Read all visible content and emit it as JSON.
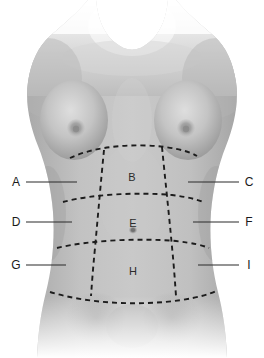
{
  "figure": {
    "width": 264,
    "height": 358,
    "background_color": "#ffffff",
    "skin_tone_mid": "#b9b9b9",
    "skin_tone_shadow": "#8f8f8f",
    "skin_tone_highlight": "#d8d8d8",
    "grid_line_color": "#1c1c1c",
    "leader_line_color": "#2a2a2a",
    "letter_color": "#2b2b2b"
  },
  "interior_regions": [
    {
      "id": "b",
      "label": "B",
      "x": 132,
      "y": 177
    },
    {
      "id": "e",
      "label": "E",
      "x": 133,
      "y": 223
    },
    {
      "id": "h",
      "label": "H",
      "x": 133,
      "y": 271
    }
  ],
  "left_labels": [
    {
      "id": "a",
      "label": "A",
      "x": 16,
      "y": 182,
      "line_x1": 26,
      "line_x2": 77,
      "line_y": 182
    },
    {
      "id": "d",
      "label": "D",
      "x": 16,
      "y": 222,
      "line_x1": 26,
      "line_x2": 72,
      "line_y": 222
    },
    {
      "id": "g",
      "label": "G",
      "x": 16,
      "y": 265,
      "line_x1": 26,
      "line_x2": 66,
      "line_y": 265
    }
  ],
  "right_labels": [
    {
      "id": "c",
      "label": "C",
      "x": 249,
      "y": 182,
      "line_x1": 188,
      "line_x2": 239,
      "line_y": 182
    },
    {
      "id": "f",
      "label": "F",
      "x": 249,
      "y": 222,
      "line_x1": 193,
      "line_x2": 239,
      "line_y": 222
    },
    {
      "id": "i",
      "label": "I",
      "x": 249,
      "y": 265,
      "line_x1": 198,
      "line_x2": 239,
      "line_y": 265
    }
  ],
  "anatomy_marks": [
    {
      "id": "umbilicus",
      "name": "navel",
      "x": 133,
      "y": 230
    },
    {
      "id": "nipple-left",
      "name": "left-nipple",
      "x": 76,
      "y": 128
    },
    {
      "id": "nipple-right",
      "name": "right-nipple",
      "x": 186,
      "y": 128
    }
  ],
  "grid": {
    "horizontal_planes": [
      {
        "id": "subcostal",
        "name": "upper-transverse-plane",
        "path": "M 70,158 C 95,146 135,143 165,147 C 180,149 190,152 197,156"
      },
      {
        "id": "transpyloric",
        "name": "middle-transverse-plane",
        "path": "M 63,202 C 92,194 140,192 172,195 C 187,197 196,199 203,202"
      },
      {
        "id": "transtubercular",
        "name": "lower-transverse-plane",
        "path": "M 57,248 C 90,240 140,238 176,241 C 192,243 202,245 209,248"
      },
      {
        "id": "inguinal",
        "name": "bottom-boundary-curve",
        "path": "M 50,292 C 90,304 140,306 182,300 C 200,297 210,294 216,291"
      }
    ],
    "vertical_planes": [
      {
        "id": "midclavicular-left",
        "name": "left-vertical-plane",
        "path": "M 104,150 C 101,180 98,215 95,248 C 93,268 92,282 91,296"
      },
      {
        "id": "midclavicular-right",
        "name": "right-vertical-plane",
        "path": "M 162,147 C 165,178 169,214 172,247 C 174,267 175,282 176,296"
      }
    ]
  }
}
